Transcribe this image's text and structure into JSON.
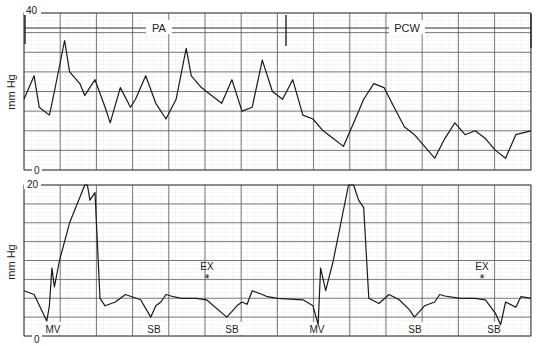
{
  "chart_data": [
    {
      "type": "line",
      "title": "Pulmonary artery to pulmonary capillary wedge pressure tracing",
      "ylabel": "mm Hg",
      "ylim": [
        0,
        40
      ],
      "y_ticks": [
        "40",
        "0"
      ],
      "grid": true,
      "annotations": [
        {
          "label": "PA",
          "x_frac": 0.27
        },
        {
          "label": "PCW",
          "x_frac": 0.71
        }
      ],
      "marker_line_x_frac": 0.51,
      "series": [
        {
          "name": "pressure",
          "x": [
            0,
            0.02,
            0.03,
            0.05,
            0.06,
            0.08,
            0.09,
            0.11,
            0.12,
            0.14,
            0.16,
            0.17,
            0.19,
            0.21,
            0.22,
            0.24,
            0.26,
            0.28,
            0.3,
            0.32,
            0.33,
            0.35,
            0.37,
            0.39,
            0.41,
            0.43,
            0.45,
            0.47,
            0.49,
            0.51,
            0.53,
            0.55,
            0.57,
            0.59,
            0.61,
            0.63,
            0.65,
            0.67,
            0.69,
            0.71,
            0.73,
            0.75,
            0.77,
            0.79,
            0.81,
            0.83,
            0.85,
            0.87,
            0.89,
            0.91,
            0.93,
            0.95,
            0.97,
            1.0
          ],
          "values": [
            18,
            24,
            16,
            14,
            20,
            33,
            25,
            22,
            19,
            23,
            16,
            12,
            21,
            16,
            18,
            24,
            17,
            13,
            18,
            31,
            24,
            21,
            19,
            17,
            23,
            15,
            16,
            28,
            20,
            18,
            23,
            14,
            13,
            10,
            8,
            6,
            12,
            18,
            22,
            21,
            16,
            11,
            9,
            6,
            3,
            8,
            12,
            9,
            10,
            8,
            5,
            3,
            9,
            10
          ]
        }
      ]
    },
    {
      "type": "line",
      "title": "Left ventricular / atrial pressure tracing",
      "ylabel": "mm Hg",
      "ylim": [
        0,
        20
      ],
      "y_ticks": [
        "20",
        "0"
      ],
      "grid": true,
      "annotations": [
        {
          "label": "MV",
          "x_frac": 0.05
        },
        {
          "label": "SB",
          "x_frac": 0.25
        },
        {
          "label": "EX",
          "symbol": "*",
          "x_frac": 0.37
        },
        {
          "label": "SB",
          "x_frac": 0.41
        },
        {
          "label": "MV",
          "x_frac": 0.58
        },
        {
          "label": "SB",
          "x_frac": 0.77
        },
        {
          "label": "EX",
          "symbol": "*",
          "x_frac": 0.9
        },
        {
          "label": "SB",
          "x_frac": 0.94
        }
      ],
      "series": [
        {
          "name": "pressure",
          "x": [
            0,
            0.02,
            0.045,
            0.05,
            0.055,
            0.06,
            0.07,
            0.09,
            0.12,
            0.125,
            0.13,
            0.14,
            0.15,
            0.16,
            0.18,
            0.2,
            0.23,
            0.25,
            0.26,
            0.27,
            0.28,
            0.29,
            0.31,
            0.34,
            0.36,
            0.4,
            0.42,
            0.43,
            0.44,
            0.45,
            0.47,
            0.48,
            0.5,
            0.55,
            0.57,
            0.58,
            0.585,
            0.595,
            0.61,
            0.64,
            0.65,
            0.66,
            0.67,
            0.68,
            0.7,
            0.72,
            0.74,
            0.76,
            0.77,
            0.79,
            0.81,
            0.82,
            0.83,
            0.86,
            0.89,
            0.91,
            0.93,
            0.94,
            0.95,
            0.97,
            0.98,
            1.0
          ],
          "values": [
            6,
            5.5,
            2,
            4,
            9,
            6.5,
            10,
            15,
            20,
            20,
            18,
            19,
            5,
            4,
            4.5,
            5.5,
            4.8,
            2.5,
            4,
            4.5,
            5.5,
            5.3,
            5,
            5,
            4.8,
            2.5,
            4,
            4.5,
            4.2,
            6,
            5.5,
            5.2,
            5,
            4.8,
            4,
            1.5,
            9,
            6,
            10,
            20,
            20,
            18,
            17,
            5,
            4.3,
            5.5,
            4.8,
            3.5,
            2.5,
            4,
            4.5,
            5.5,
            5.3,
            5,
            5,
            4.8,
            3,
            1.5,
            4.5,
            3.8,
            5.2,
            5
          ]
        }
      ]
    }
  ],
  "top_panel": {
    "ylabel": "mm Hg",
    "y_max_label": "40",
    "y_min_label": "0",
    "label_left": "PA",
    "label_right": "PCW"
  },
  "bottom_panel": {
    "ylabel": "mm Hg",
    "y_max_label": "20",
    "y_min_label": "0",
    "labels": {
      "mv1": "MV",
      "sb1": "SB",
      "ex1": "EX",
      "ex1_symbol": "*",
      "sb2": "SB",
      "mv2": "MV",
      "sb3": "SB",
      "ex2": "EX",
      "ex2_symbol": "*",
      "sb4": "SB"
    }
  }
}
